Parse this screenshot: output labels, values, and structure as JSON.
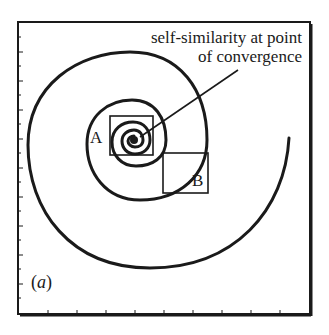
{
  "figure": {
    "panel_label": "(a)",
    "annotation_line1": "self-similarity at point",
    "annotation_line2": "of convergence",
    "box_a_label": "A",
    "box_b_label": "B",
    "colors": {
      "ink": "#1a1a1a",
      "background": "#ffffff"
    }
  }
}
